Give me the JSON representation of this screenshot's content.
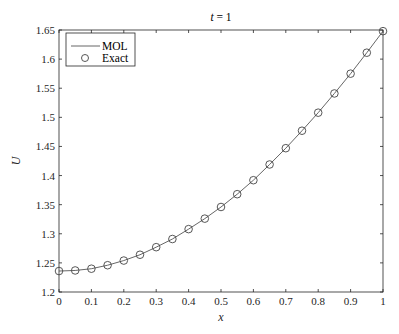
{
  "chart_data": {
    "type": "line",
    "title": "t = 1",
    "title_italic_part": "t",
    "title_rest": " = 1",
    "xlabel": "x",
    "ylabel": "U",
    "xlim": [
      0,
      1
    ],
    "ylim": [
      1.2,
      1.65
    ],
    "xticks": [
      0,
      0.1,
      0.2,
      0.3,
      0.4,
      0.5,
      0.6,
      0.7,
      0.8,
      0.9,
      1
    ],
    "xtick_labels": [
      "0",
      "0.1",
      "0.2",
      "0.3",
      "0.4",
      "0.5",
      "0.6",
      "0.7",
      "0.8",
      "0.9",
      "1"
    ],
    "yticks": [
      1.2,
      1.25,
      1.3,
      1.35,
      1.4,
      1.45,
      1.5,
      1.55,
      1.6,
      1.65
    ],
    "ytick_labels": [
      "1.2",
      "1.25",
      "1.3",
      "1.35",
      "1.4",
      "1.45",
      "1.5",
      "1.55",
      "1.6",
      "1.65"
    ],
    "grid": false,
    "legend_position": "upper left",
    "x": [
      0,
      0.05,
      0.1,
      0.15,
      0.2,
      0.25,
      0.3,
      0.35,
      0.4,
      0.45,
      0.5,
      0.55,
      0.6,
      0.65,
      0.7,
      0.75,
      0.8,
      0.85,
      0.9,
      0.95,
      1.0
    ],
    "series": [
      {
        "name": "MOL",
        "style": "line",
        "color": "#555555",
        "values": [
          1.236,
          1.237,
          1.24,
          1.246,
          1.254,
          1.264,
          1.277,
          1.291,
          1.308,
          1.326,
          1.346,
          1.368,
          1.392,
          1.419,
          1.447,
          1.477,
          1.508,
          1.541,
          1.575,
          1.611,
          1.648
        ]
      },
      {
        "name": "Exact",
        "style": "marker-circle",
        "color": "#444444",
        "values": [
          1.236,
          1.237,
          1.24,
          1.246,
          1.254,
          1.264,
          1.277,
          1.291,
          1.308,
          1.326,
          1.346,
          1.368,
          1.392,
          1.419,
          1.447,
          1.477,
          1.508,
          1.541,
          1.575,
          1.611,
          1.648
        ]
      }
    ]
  },
  "legend": {
    "items": [
      {
        "label": "MOL",
        "symbol": "line"
      },
      {
        "label": "Exact",
        "symbol": "circle"
      }
    ]
  }
}
